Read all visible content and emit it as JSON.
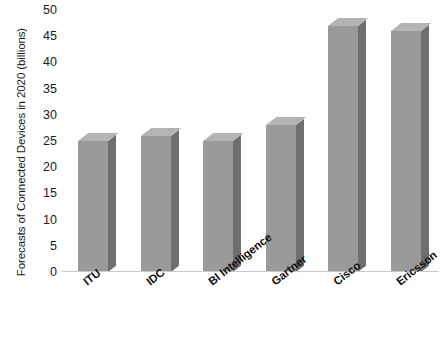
{
  "chart_data": {
    "type": "bar",
    "title": "",
    "xlabel": "",
    "ylabel": "Forecasts of Connected Devices in 2020 (billions)",
    "ylim": [
      0,
      50
    ],
    "yticks": [
      0,
      5,
      10,
      15,
      20,
      25,
      30,
      35,
      40,
      45,
      50
    ],
    "grid": false,
    "legend": false,
    "categories": [
      "ITU",
      "IDC",
      "BI Intelligence",
      "Gartner",
      "Cisco",
      "Ericsson"
    ],
    "values": [
      25,
      26,
      25,
      28,
      47,
      46
    ],
    "bar_color": "#9a9a9a",
    "bar_side_color": "#6f6f6f",
    "bar_top_color": "#b4b4b4",
    "background_color": "#ffffff",
    "axis_color": "#c9c9c9",
    "text_color": "#1a1a1a"
  }
}
